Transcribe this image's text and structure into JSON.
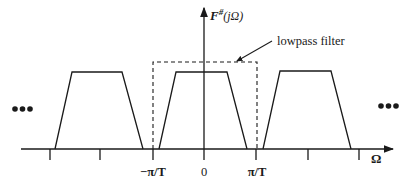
{
  "diagram": {
    "type": "spectrum-replicas",
    "vertical_axis_label": "F",
    "vertical_axis_label_superscript": "#",
    "vertical_axis_label_arg": "(jΩ)",
    "horizontal_axis_label": "Ω",
    "filter_label": "lowpass filter",
    "tick_labels": {
      "neg": "−π/T",
      "zero": "0",
      "pos": "π/T"
    },
    "ellipsis_left": "•••",
    "ellipsis_right": "•••",
    "replicas": [
      {
        "name": "replica-left",
        "center_multiple": -2
      },
      {
        "name": "replica-center",
        "center_multiple": 0
      },
      {
        "name": "replica-right",
        "center_multiple": 2
      }
    ],
    "filter_cutoff": "±π/T"
  }
}
